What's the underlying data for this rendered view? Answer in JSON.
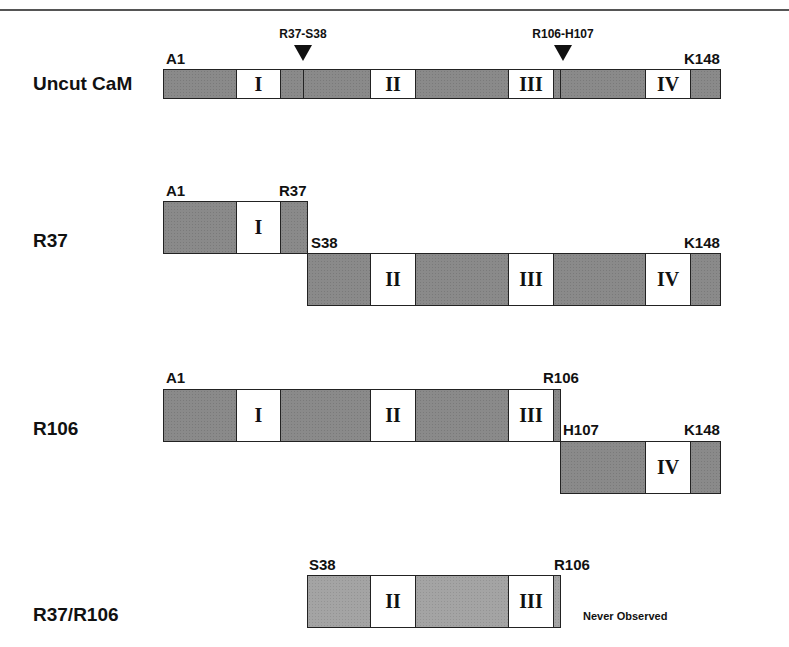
{
  "figure": {
    "rows": [
      {
        "label": "Uncut CaM"
      },
      {
        "label": "R37"
      },
      {
        "label": "R106"
      },
      {
        "label": "R37/R106"
      }
    ],
    "cut_sites": [
      {
        "label": "R37-S38"
      },
      {
        "label": "R106-H107"
      }
    ],
    "residue_tags": {
      "uncut_start": "A1",
      "uncut_end": "K148",
      "r37_frag1_start": "A1",
      "r37_frag1_end": "R37",
      "r37_frag2_start": "S38",
      "r37_frag2_end": "K148",
      "r106_frag1_start": "A1",
      "r106_frag1_end": "R106",
      "r106_frag2_start": "H107",
      "r106_frag2_end": "K148",
      "double_start": "S38",
      "double_end": "R106"
    },
    "domains": [
      "I",
      "II",
      "III",
      "IV"
    ],
    "note": "Never Observed",
    "colors": {
      "domain_fill": "#ffffff",
      "linker_fill": "#8a8a8a",
      "unobserved_fill": "#a4a4a4",
      "outline": "#222222"
    }
  }
}
